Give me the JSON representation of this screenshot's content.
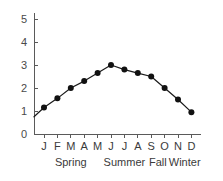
{
  "chart_data": {
    "type": "line",
    "title": "",
    "subtitle": "",
    "xlabel": "",
    "ylabel": "",
    "categories": [
      "J",
      "F",
      "M",
      "A",
      "M",
      "J",
      "J",
      "A",
      "S",
      "O",
      "N",
      "D"
    ],
    "month_names": [
      "January",
      "February",
      "March",
      "April",
      "May",
      "June",
      "July",
      "August",
      "September",
      "October",
      "November",
      "December"
    ],
    "values": [
      1.15,
      1.55,
      2.0,
      2.3,
      2.65,
      3.0,
      2.8,
      2.65,
      2.5,
      2.0,
      1.5,
      0.95
    ],
    "ylim": [
      0,
      5
    ],
    "yticks": [
      0,
      1,
      2,
      3,
      4,
      5
    ],
    "ytick_labels": [
      "0",
      "1",
      "2",
      "3",
      "4",
      "5"
    ],
    "grid": false,
    "legend": false,
    "legend_position": "none",
    "marker": "filled-circle",
    "line_color": "#111111",
    "marker_color": "#111111",
    "axis_color": "#5a5a5a",
    "background": "#ffffff",
    "line_extends_to_axis": true,
    "axis_intercept_value": 0.75,
    "season_groups": [
      {
        "label": "Spring",
        "months": [
          "F",
          "M",
          "A"
        ],
        "center_index": 2
      },
      {
        "label": "Summer",
        "months": [
          "J",
          "J",
          "A"
        ],
        "center_index": 6
      },
      {
        "label": "Fall",
        "months": [
          "S",
          "O"
        ],
        "center_index": 8.5
      },
      {
        "label": "Winter",
        "months": [
          "N",
          "D"
        ],
        "center_index": 10.5
      }
    ]
  }
}
